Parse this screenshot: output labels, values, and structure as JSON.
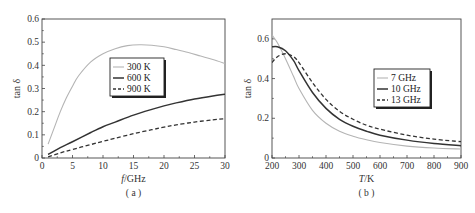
{
  "chart_data": [
    {
      "id": "a",
      "type": "line",
      "caption": "( a )",
      "title": "",
      "xlabel_italic": "f",
      "xlabel_rest": "/GHz",
      "ylabel": "tan δ",
      "xlim": [
        0,
        30
      ],
      "ylim": [
        0,
        0.6
      ],
      "xticks": [
        0,
        5,
        10,
        15,
        20,
        25,
        30
      ],
      "yticks": [
        0,
        0.1,
        0.2,
        0.3,
        0.4,
        0.5,
        0.6
      ],
      "ytick_labels": [
        "0",
        "0.1",
        "0.2",
        "0.3",
        "0.4",
        "0.5",
        "0.6"
      ],
      "grid": false,
      "legend_position": "upper-center",
      "series": [
        {
          "name": "300 K",
          "style": "solid-gray",
          "x": [
            1,
            2,
            3,
            4,
            5,
            6,
            8,
            10,
            12,
            14,
            16,
            18,
            20,
            22,
            24,
            26,
            28,
            30
          ],
          "y": [
            0.06,
            0.13,
            0.2,
            0.26,
            0.31,
            0.355,
            0.415,
            0.45,
            0.472,
            0.485,
            0.489,
            0.487,
            0.48,
            0.468,
            0.455,
            0.44,
            0.425,
            0.408
          ]
        },
        {
          "name": "600 K",
          "style": "solid-black",
          "x": [
            1,
            3,
            5,
            8,
            10,
            12,
            15,
            18,
            20,
            22,
            25,
            28,
            30
          ],
          "y": [
            0.015,
            0.045,
            0.07,
            0.11,
            0.135,
            0.155,
            0.185,
            0.21,
            0.225,
            0.238,
            0.255,
            0.268,
            0.275
          ]
        },
        {
          "name": "900 K",
          "style": "dashed-black",
          "x": [
            1,
            3,
            5,
            8,
            10,
            12,
            15,
            18,
            20,
            22,
            25,
            28,
            30
          ],
          "y": [
            0.005,
            0.022,
            0.037,
            0.058,
            0.072,
            0.085,
            0.105,
            0.122,
            0.133,
            0.143,
            0.155,
            0.165,
            0.17
          ]
        }
      ]
    },
    {
      "id": "b",
      "type": "line",
      "caption": "( b )",
      "title": "",
      "xlabel_italic": "T",
      "xlabel_rest": "/K",
      "ylabel": "tan δ",
      "xlim": [
        200,
        900
      ],
      "ylim": [
        0,
        0.7
      ],
      "xticks": [
        200,
        300,
        400,
        500,
        600,
        700,
        800,
        900
      ],
      "yticks": [
        0,
        0.2,
        0.4,
        0.6
      ],
      "ytick_labels": [
        "0",
        "0.2",
        "0.4",
        "0.6"
      ],
      "grid": false,
      "legend_position": "center-right",
      "series": [
        {
          "name": "7 GHz",
          "style": "solid-gray",
          "x": [
            200,
            220,
            250,
            280,
            300,
            350,
            400,
            450,
            500,
            550,
            600,
            700,
            800,
            900
          ],
          "y": [
            0.62,
            0.58,
            0.5,
            0.41,
            0.35,
            0.24,
            0.175,
            0.135,
            0.11,
            0.092,
            0.078,
            0.06,
            0.05,
            0.045
          ]
        },
        {
          "name": "10 GHz",
          "style": "solid-black",
          "x": [
            200,
            220,
            250,
            280,
            300,
            350,
            400,
            450,
            500,
            550,
            600,
            700,
            800,
            900
          ],
          "y": [
            0.56,
            0.56,
            0.54,
            0.49,
            0.44,
            0.33,
            0.25,
            0.195,
            0.16,
            0.135,
            0.115,
            0.09,
            0.073,
            0.062
          ]
        },
        {
          "name": "13 GHz",
          "style": "dashed-black",
          "x": [
            200,
            220,
            250,
            280,
            300,
            350,
            400,
            450,
            500,
            550,
            600,
            700,
            800,
            900
          ],
          "y": [
            0.48,
            0.51,
            0.525,
            0.51,
            0.48,
            0.38,
            0.295,
            0.235,
            0.195,
            0.165,
            0.145,
            0.115,
            0.095,
            0.082
          ]
        }
      ]
    }
  ]
}
